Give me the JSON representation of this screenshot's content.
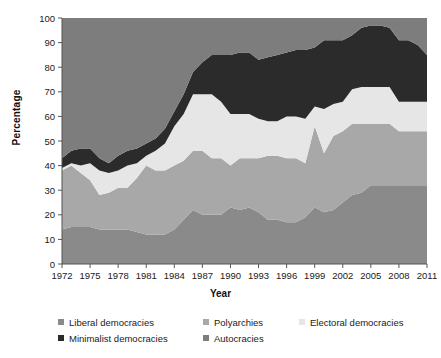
{
  "chart_data": {
    "type": "area",
    "stacked": true,
    "title": "",
    "xlabel": "Year",
    "ylabel": "Percentage",
    "ylim": [
      0,
      100
    ],
    "ytick_values": [
      0,
      10,
      20,
      30,
      40,
      50,
      60,
      70,
      80,
      90,
      100
    ],
    "ytick_labels": [
      "0",
      "10",
      "20",
      "30",
      "40",
      "50",
      "60",
      "70",
      "80",
      "90",
      "100"
    ],
    "xlim": [
      1972,
      2011
    ],
    "xtick_values": [
      1972,
      1975,
      1978,
      1981,
      1984,
      1987,
      1990,
      1993,
      1996,
      1999,
      2002,
      2005,
      2008,
      2011
    ],
    "xtick_labels": [
      "1972",
      "1975",
      "1978",
      "1981",
      "1984",
      "1987",
      "1990",
      "1993",
      "1996",
      "1999",
      "2002",
      "2005",
      "2008",
      "2011"
    ],
    "grid": false,
    "legend_position": "bottom",
    "x": [
      1972,
      1973,
      1974,
      1975,
      1976,
      1977,
      1978,
      1979,
      1980,
      1981,
      1982,
      1983,
      1984,
      1985,
      1986,
      1987,
      1988,
      1989,
      1990,
      1991,
      1992,
      1993,
      1994,
      1995,
      1996,
      1997,
      1998,
      1999,
      2000,
      2001,
      2002,
      2003,
      2004,
      2005,
      2006,
      2007,
      2008,
      2009,
      2010,
      2011
    ],
    "series": [
      {
        "name": "Liberal democracies",
        "color": "#8a8a8a",
        "values": [
          14,
          15,
          15,
          15,
          14,
          14,
          14,
          14,
          13,
          12,
          12,
          12,
          14,
          18,
          22,
          20,
          20,
          20,
          23,
          22,
          23,
          21,
          18,
          18,
          17,
          17,
          19,
          23,
          21,
          22,
          25,
          28,
          29,
          32,
          32,
          32,
          32,
          32,
          32,
          32
        ]
      },
      {
        "name": "Polyarchies",
        "color": "#a8a8a8",
        "values": [
          24,
          25,
          22,
          19,
          14,
          15,
          17,
          17,
          22,
          28,
          26,
          26,
          26,
          24,
          24,
          26,
          23,
          23,
          17,
          21,
          20,
          22,
          26,
          26,
          26,
          26,
          22,
          33,
          24,
          30,
          29,
          29,
          28,
          25,
          25,
          25,
          22,
          22,
          22,
          22
        ]
      },
      {
        "name": "Electoral democracies",
        "color": "#e6e6e6",
        "values": [
          1,
          1,
          3,
          7,
          10,
          8,
          7,
          9,
          6,
          4,
          8,
          11,
          16,
          19,
          23,
          23,
          26,
          23,
          21,
          18,
          18,
          16,
          14,
          14,
          17,
          17,
          18,
          8,
          18,
          13,
          12,
          14,
          15,
          15,
          15,
          15,
          12,
          12,
          12,
          12
        ]
      },
      {
        "name": "Minimalist democracies",
        "color": "#2b2b2b",
        "values": [
          4,
          5,
          7,
          6,
          5,
          4,
          6,
          6,
          6,
          5,
          5,
          6,
          6,
          8,
          9,
          13,
          16,
          19,
          24,
          25,
          25,
          24,
          26,
          27,
          26,
          27,
          28,
          24,
          28,
          26,
          25,
          22,
          24,
          25,
          25,
          24,
          25,
          25,
          23,
          19
        ]
      },
      {
        "name": "Autocracies",
        "color": "#7d7d7d",
        "values": [
          57,
          54,
          53,
          53,
          57,
          59,
          56,
          54,
          53,
          51,
          49,
          45,
          38,
          31,
          22,
          18,
          15,
          15,
          15,
          14,
          14,
          17,
          16,
          15,
          14,
          13,
          13,
          12,
          9,
          9,
          9,
          7,
          4,
          3,
          3,
          4,
          9,
          9,
          11,
          15
        ]
      }
    ]
  },
  "legend": {
    "items": [
      {
        "label": "Liberal democracies",
        "color": "#8a8a8a"
      },
      {
        "label": "Polyarchies",
        "color": "#a8a8a8"
      },
      {
        "label": "Electoral democracies",
        "color": "#e6e6e6"
      },
      {
        "label": "Minimalist democracies",
        "color": "#2b2b2b"
      },
      {
        "label": "Autocracies",
        "color": "#7d7d7d"
      }
    ]
  }
}
